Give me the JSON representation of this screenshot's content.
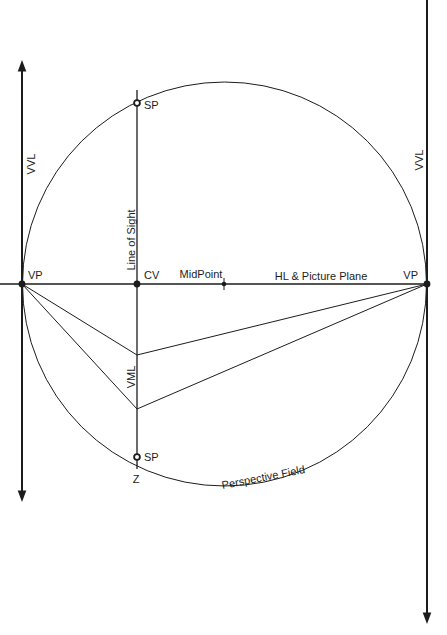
{
  "diagram": {
    "colors": {
      "background": "#ffffff",
      "line": "#1c1c1c",
      "text": "#1c1c1c"
    },
    "labels": {
      "vvl_left": "VVL",
      "vvl_right": "VVL",
      "vp_left": "VP",
      "vp_right": "VP",
      "cv": "CV",
      "midpoint": "MidPoint",
      "hl_picture_plane": "HL & Picture Plane",
      "sp_top": "SP",
      "sp_bottom": "SP",
      "z": "Z",
      "line_of_sight": "Line of Sight",
      "vml": "VML",
      "perspective_field": "Perspective Field"
    }
  }
}
